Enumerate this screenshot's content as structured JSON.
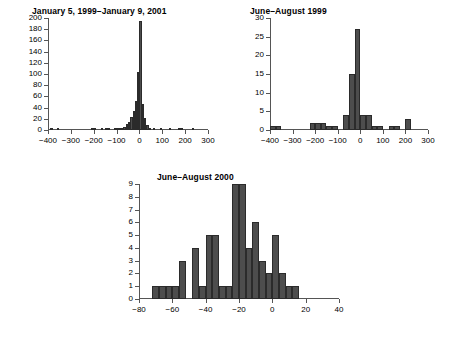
{
  "figure": {
    "background": "#ffffff",
    "bar_color": "#4d4d4d",
    "bar_edge_color": "#2b2b2b",
    "axis_color": "#555555"
  },
  "chart_data": [
    {
      "id": "panel-1",
      "type": "bar",
      "title": "January 5, 1999–January 9, 2001",
      "xlabel": "",
      "ylabel": "",
      "xlim": [
        -400,
        300
      ],
      "ylim": [
        0,
        200
      ],
      "grid": false,
      "legend": "none",
      "xticks": [
        -400,
        -300,
        -200,
        -100,
        0,
        100,
        200,
        300
      ],
      "xtick_labels": [
        "−400",
        "−300",
        "−200",
        "−100",
        "0",
        "100",
        "200",
        "300"
      ],
      "yticks": [
        0,
        20,
        40,
        60,
        80,
        100,
        120,
        140,
        160,
        180,
        200
      ],
      "ytick_labels": [
        "0",
        "20",
        "40",
        "60",
        "80",
        "100",
        "120",
        "140",
        "160",
        "180",
        "200"
      ],
      "bin_width": 10,
      "bins": [
        {
          "x0": -390,
          "value": 1
        },
        {
          "x0": -360,
          "value": 1
        },
        {
          "x0": -210,
          "value": 2
        },
        {
          "x0": -200,
          "value": 1
        },
        {
          "x0": -170,
          "value": 1
        },
        {
          "x0": -150,
          "value": 2
        },
        {
          "x0": -140,
          "value": 1
        },
        {
          "x0": -110,
          "value": 2
        },
        {
          "x0": -100,
          "value": 2
        },
        {
          "x0": -90,
          "value": 3
        },
        {
          "x0": -80,
          "value": 4
        },
        {
          "x0": -70,
          "value": 6
        },
        {
          "x0": -60,
          "value": 10
        },
        {
          "x0": -50,
          "value": 15
        },
        {
          "x0": -40,
          "value": 23
        },
        {
          "x0": -30,
          "value": 34
        },
        {
          "x0": -20,
          "value": 52
        },
        {
          "x0": -10,
          "value": 103
        },
        {
          "x0": 0,
          "value": 195
        },
        {
          "x0": 10,
          "value": 47
        },
        {
          "x0": 20,
          "value": 22
        },
        {
          "x0": 30,
          "value": 9
        },
        {
          "x0": 40,
          "value": 4
        },
        {
          "x0": 60,
          "value": 2
        },
        {
          "x0": 90,
          "value": 2
        },
        {
          "x0": 130,
          "value": 1
        },
        {
          "x0": 170,
          "value": 2
        },
        {
          "x0": 180,
          "value": 1
        },
        {
          "x0": 230,
          "value": 3
        }
      ]
    },
    {
      "id": "panel-2",
      "type": "bar",
      "title": "June–August 1999",
      "xlabel": "",
      "ylabel": "",
      "xlim": [
        -400,
        300
      ],
      "ylim": [
        0,
        30
      ],
      "grid": false,
      "legend": "none",
      "xticks": [
        -400,
        -300,
        -200,
        -100,
        0,
        100,
        200,
        300
      ],
      "xtick_labels": [
        "−400",
        "−300",
        "−200",
        "−100",
        "0",
        "100",
        "200",
        "300"
      ],
      "yticks": [
        0,
        5,
        10,
        15,
        20,
        25,
        30
      ],
      "ytick_labels": [
        "0",
        "5",
        "10",
        "15",
        "20",
        "25",
        "30"
      ],
      "bin_width": 25,
      "bins": [
        {
          "x0": -400,
          "value": 1
        },
        {
          "x0": -375,
          "value": 1
        },
        {
          "x0": -225,
          "value": 2
        },
        {
          "x0": -200,
          "value": 2
        },
        {
          "x0": -175,
          "value": 2
        },
        {
          "x0": -150,
          "value": 1
        },
        {
          "x0": -125,
          "value": 1
        },
        {
          "x0": -75,
          "value": 4
        },
        {
          "x0": -50,
          "value": 15
        },
        {
          "x0": -25,
          "value": 27
        },
        {
          "x0": 0,
          "value": 4
        },
        {
          "x0": 25,
          "value": 4
        },
        {
          "x0": 50,
          "value": 1
        },
        {
          "x0": 75,
          "value": 1
        },
        {
          "x0": 125,
          "value": 1
        },
        {
          "x0": 150,
          "value": 1
        },
        {
          "x0": 200,
          "value": 3
        }
      ]
    },
    {
      "id": "panel-3",
      "type": "bar",
      "title": "June–August 2000",
      "xlabel": "",
      "ylabel": "",
      "xlim": [
        -80,
        40
      ],
      "ylim": [
        0,
        9
      ],
      "grid": false,
      "legend": "none",
      "xticks": [
        -80,
        -60,
        -40,
        -20,
        0,
        20,
        40
      ],
      "xtick_labels": [
        "−80",
        "−60",
        "−40",
        "−20",
        "0",
        "20",
        "40"
      ],
      "yticks": [
        0,
        1,
        2,
        3,
        4,
        5,
        6,
        7,
        8,
        9
      ],
      "ytick_labels": [
        "0",
        "1",
        "2",
        "3",
        "4",
        "5",
        "6",
        "7",
        "8",
        "9"
      ],
      "bin_width": 4,
      "bins": [
        {
          "x0": -72,
          "value": 1
        },
        {
          "x0": -68,
          "value": 1
        },
        {
          "x0": -64,
          "value": 1
        },
        {
          "x0": -60,
          "value": 1
        },
        {
          "x0": -56,
          "value": 3
        },
        {
          "x0": -48,
          "value": 4
        },
        {
          "x0": -44,
          "value": 1
        },
        {
          "x0": -40,
          "value": 5
        },
        {
          "x0": -36,
          "value": 5
        },
        {
          "x0": -32,
          "value": 1
        },
        {
          "x0": -28,
          "value": 1
        },
        {
          "x0": -24,
          "value": 9
        },
        {
          "x0": -20,
          "value": 9
        },
        {
          "x0": -16,
          "value": 4
        },
        {
          "x0": -12,
          "value": 6
        },
        {
          "x0": -8,
          "value": 3
        },
        {
          "x0": -4,
          "value": 2
        },
        {
          "x0": 0,
          "value": 5
        },
        {
          "x0": 4,
          "value": 2
        },
        {
          "x0": 8,
          "value": 1
        },
        {
          "x0": 12,
          "value": 1
        }
      ]
    }
  ]
}
